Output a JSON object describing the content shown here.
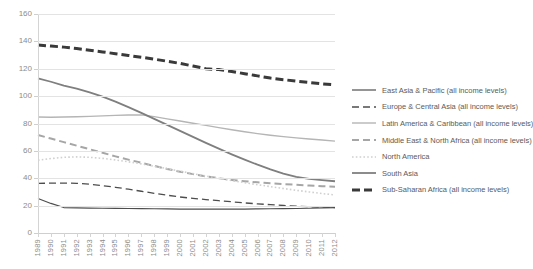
{
  "chart": {
    "type": "line",
    "background": "#ffffff"
  },
  "axis": {
    "y_ticks": [
      "0",
      "20",
      "40",
      "60",
      "80",
      "100",
      "120",
      "140",
      "160"
    ],
    "x_ticks": [
      "1989",
      "1990",
      "1991",
      "1992",
      "1993",
      "1994",
      "1995",
      "1996",
      "1997",
      "1998",
      "1999",
      "2000",
      "2001",
      "2002",
      "2003",
      "2004",
      "2005",
      "2006",
      "2007",
      "2008",
      "2009",
      "2010",
      "2011",
      "2012"
    ]
  },
  "legend": {
    "items": [
      {
        "label": "East Asia & Pacific (all income levels)",
        "style": "solid",
        "color": "#4d4d4d",
        "width": 1.2,
        "dash": ""
      },
      {
        "label": "Europe & Central Asia (all income levels)",
        "style": "dashed",
        "color": "#4d4d4d",
        "width": 1.3,
        "dash": "7,4"
      },
      {
        "label": "Latin America & Caribbean (all income levels)",
        "style": "solid",
        "color": "#b5b5b5",
        "width": 1.4,
        "dash": ""
      },
      {
        "label": "Middle East & North Africa (all income levels)",
        "style": "dashed",
        "color": "#a6a6a6",
        "width": 2.0,
        "dash": "7,4"
      },
      {
        "label": "North America",
        "style": "dotted",
        "color": "#d0d0d0",
        "width": 1.6,
        "dash": "1.6,2.2"
      },
      {
        "label": "South Asia",
        "style": "solid",
        "color": "#7f7f7f",
        "width": 1.8,
        "dash": ""
      },
      {
        "label": "Sub-Saharan Africa (all income levels)",
        "style": "dashed",
        "color": "#3a3a3a",
        "width": 3.0,
        "dash": "8,4"
      }
    ]
  },
  "chart_data": {
    "type": "line",
    "title": "",
    "subtitle": "",
    "xlabel": "",
    "ylabel": "",
    "xlim": [
      1989,
      2012
    ],
    "ylim": [
      0,
      160
    ],
    "ytick_step": 20,
    "grid": true,
    "legend_position": "right",
    "x": [
      1989,
      1990,
      1991,
      1992,
      1993,
      1994,
      1995,
      1996,
      1997,
      1998,
      1999,
      2000,
      2001,
      2002,
      2003,
      2004,
      2005,
      2006,
      2007,
      2008,
      2009,
      2010,
      2011,
      2012
    ],
    "series": [
      {
        "name": "East Asia & Pacific (all income levels)",
        "color": "#4d4d4d",
        "dash": "",
        "width": 1.2,
        "values": [
          25.2,
          21.6,
          18.6,
          18.3,
          18.2,
          18.1,
          18.0,
          17.9,
          17.8,
          17.7,
          17.6,
          17.5,
          17.4,
          17.4,
          17.4,
          17.4,
          17.5,
          17.6,
          17.7,
          17.8,
          17.9,
          18.1,
          18.3,
          18.5
        ]
      },
      {
        "name": "Europe & Central Asia (all income levels)",
        "color": "#4d4d4d",
        "dash": "7,4",
        "width": 1.3,
        "values": [
          36.3,
          36.4,
          36.5,
          36.3,
          35.6,
          34.6,
          33.4,
          32.0,
          30.5,
          29.0,
          27.6,
          26.3,
          25.3,
          24.4,
          23.6,
          22.8,
          22.0,
          21.3,
          20.7,
          20.1,
          19.6,
          19.2,
          18.9,
          18.6
        ]
      },
      {
        "name": "Latin America & Caribbean (all income levels)",
        "color": "#b5b5b5",
        "dash": "",
        "width": 1.4,
        "values": [
          84.8,
          84.6,
          84.7,
          84.9,
          85.2,
          85.6,
          85.9,
          86.2,
          86.3,
          85.0,
          83.4,
          81.8,
          80.2,
          78.6,
          77.0,
          75.4,
          74.0,
          72.6,
          71.4,
          70.4,
          69.5,
          68.7,
          67.9,
          67.1
        ]
      },
      {
        "name": "Middle East & North Africa (all income levels)",
        "color": "#a6a6a6",
        "dash": "7,4",
        "width": 2.0,
        "values": [
          71.6,
          69.0,
          66.4,
          63.8,
          61.2,
          58.6,
          56.0,
          53.6,
          51.3,
          49.0,
          46.8,
          44.8,
          43.0,
          41.4,
          40.0,
          38.8,
          37.8,
          37.0,
          36.3,
          35.7,
          35.2,
          34.7,
          34.2,
          33.8
        ]
      },
      {
        "name": "North America",
        "color": "#d0d0d0",
        "dash": "1.6,2.2",
        "width": 1.6,
        "values": [
          53.2,
          54.4,
          55.3,
          55.6,
          55.3,
          54.5,
          53.4,
          52.0,
          50.5,
          48.8,
          47.0,
          45.2,
          43.4,
          41.6,
          39.9,
          38.3,
          36.8,
          35.3,
          33.9,
          32.5,
          31.2,
          30.0,
          28.8,
          27.8
        ]
      },
      {
        "name": "South Asia",
        "color": "#7f7f7f",
        "dash": "",
        "width": 1.8,
        "values": [
          113.0,
          110.5,
          107.6,
          105.5,
          102.8,
          99.6,
          96.0,
          92.0,
          87.8,
          83.4,
          79.0,
          74.6,
          70.2,
          65.8,
          61.6,
          57.5,
          53.6,
          49.9,
          46.5,
          43.4,
          41.0,
          39.6,
          38.6,
          37.8
        ]
      },
      {
        "name": "Sub-Saharan Africa (all income levels)",
        "color": "#3a3a3a",
        "dash": "8,4",
        "width": 3.0,
        "values": [
          137.3,
          136.6,
          135.8,
          134.8,
          133.6,
          132.3,
          131.0,
          129.7,
          128.4,
          127.0,
          125.5,
          123.9,
          122.0,
          120.0,
          119.4,
          118.0,
          116.4,
          114.8,
          113.2,
          112.0,
          111.0,
          110.0,
          109.0,
          108.2
        ]
      }
    ]
  }
}
